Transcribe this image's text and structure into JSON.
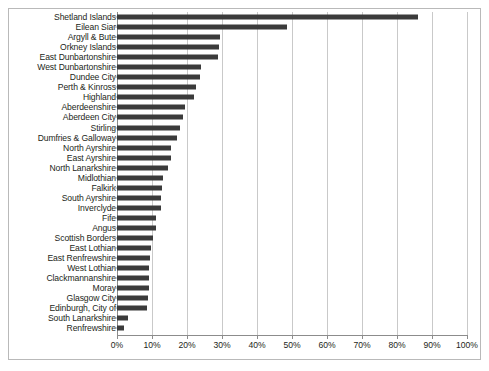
{
  "chart_data": {
    "type": "bar",
    "orientation": "horizontal",
    "title": "",
    "subtitle": "",
    "xlabel": "",
    "ylabel": "",
    "xlim": [
      0,
      100
    ],
    "xtick_labels": [
      "0%",
      "10%",
      "20%",
      "30%",
      "40%",
      "50%",
      "60%",
      "70%",
      "80%",
      "90%",
      "100%"
    ],
    "xtick_values": [
      0,
      10,
      20,
      30,
      40,
      50,
      60,
      70,
      80,
      90,
      100
    ],
    "grid": true,
    "legend": null,
    "bar_color": "#3b3b3b",
    "axis_color": "#8c8c8c",
    "gridline_color": "#c9c9c9",
    "frame_color": "#b9b9b9",
    "background": "#ffffff",
    "categories": [
      "Shetland Islands",
      "Eilean Siar",
      "Argyll & Bute",
      "Orkney Islands",
      "East Dunbartonshire",
      "West Dunbartonshire",
      "Dundee City",
      "Perth & Kinross",
      "Highland",
      "Aberdeenshire",
      "Aberdeen City",
      "Stirling",
      "Dumfries & Galloway",
      "North Ayrshire",
      "East Ayrshire",
      "North Lanarkshire",
      "Midlothian",
      "Falkirk",
      "South Ayrshire",
      "Inverclyde",
      "Fife",
      "Angus",
      "Scottish Borders",
      "East Lothian",
      "East Renfrewshire",
      "West Lothian",
      "Clackmannanshire",
      "Moray",
      "Glasgow City",
      "Edinburgh, City of",
      "South Lanarkshire",
      "Renfrewshire"
    ],
    "values": [
      86.0,
      48.5,
      29.5,
      29.0,
      28.8,
      24.0,
      23.8,
      22.5,
      22.0,
      19.5,
      18.8,
      18.0,
      17.0,
      15.5,
      15.3,
      14.5,
      13.0,
      12.8,
      12.5,
      12.5,
      11.2,
      11.0,
      10.2,
      9.8,
      9.5,
      9.2,
      9.0,
      9.0,
      8.8,
      8.5,
      3.2,
      2.0
    ]
  }
}
